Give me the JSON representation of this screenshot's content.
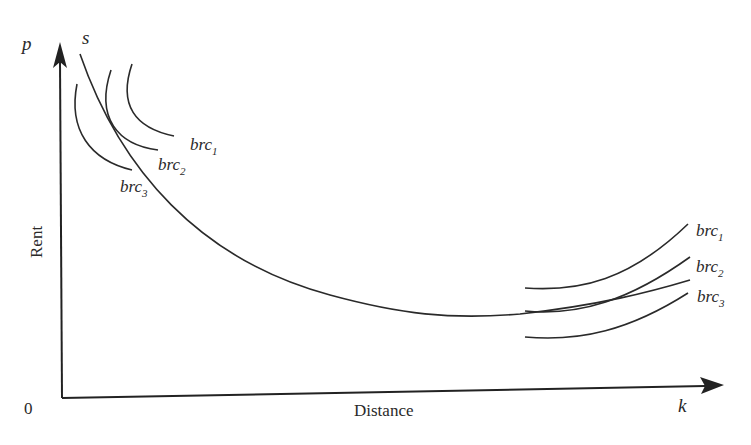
{
  "diagram": {
    "type": "bid-rent curves vs supply curve",
    "axes": {
      "y_symbol": "p",
      "y_label": "Rent",
      "x_symbol": "k",
      "x_label": "Distance",
      "origin": "0"
    },
    "supply_curve_label": "s",
    "left_group": {
      "labels": [
        {
          "base": "brc",
          "sub": "1"
        },
        {
          "base": "brc",
          "sub": "2"
        },
        {
          "base": "brc",
          "sub": "3"
        }
      ]
    },
    "right_group": {
      "labels": [
        {
          "base": "brc",
          "sub": "1"
        },
        {
          "base": "brc",
          "sub": "2"
        },
        {
          "base": "brc",
          "sub": "3"
        }
      ]
    }
  }
}
